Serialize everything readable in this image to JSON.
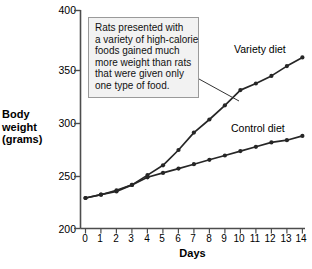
{
  "chart_data": {
    "type": "line",
    "title": "",
    "xlabel": "Days",
    "ylabel": "Body weight (grams)",
    "ylabel_lines": [
      "Body",
      "weight",
      "(grams)"
    ],
    "x": [
      0,
      1,
      2,
      3,
      4,
      5,
      6,
      7,
      8,
      9,
      10,
      11,
      12,
      13,
      14
    ],
    "xlim": [
      0,
      14
    ],
    "ylim": [
      200,
      400
    ],
    "xticks": [
      "0",
      "1",
      "2",
      "3",
      "4",
      "5",
      "6",
      "7",
      "8",
      "9",
      "10",
      "11",
      "12",
      "13",
      "14"
    ],
    "yticks": [
      "200",
      "250",
      "300",
      "350",
      "400"
    ],
    "grid": false,
    "legend_position": "inline-labels",
    "series": [
      {
        "name": "Variety diet",
        "color": "#262626",
        "values": [
          228,
          231,
          234,
          240,
          249,
          258,
          272,
          288,
          300,
          313,
          327,
          333,
          340,
          349,
          357
        ]
      },
      {
        "name": "Control diet",
        "color": "#262626",
        "values": [
          228,
          231,
          235,
          240,
          247,
          251,
          255,
          259,
          263,
          267,
          271,
          275,
          279,
          281,
          285
        ]
      }
    ],
    "annotations": [
      {
        "text": "Rats presented with a variety of high-calorie foods gained much more weight than rats that were given only one type of food.",
        "lines": [
          "Rats presented with",
          "a variety of high-calorie",
          "foods gained much",
          "more weight than rats",
          "that were given only",
          "one type of food."
        ],
        "points_to": "Variety diet curve"
      }
    ]
  }
}
